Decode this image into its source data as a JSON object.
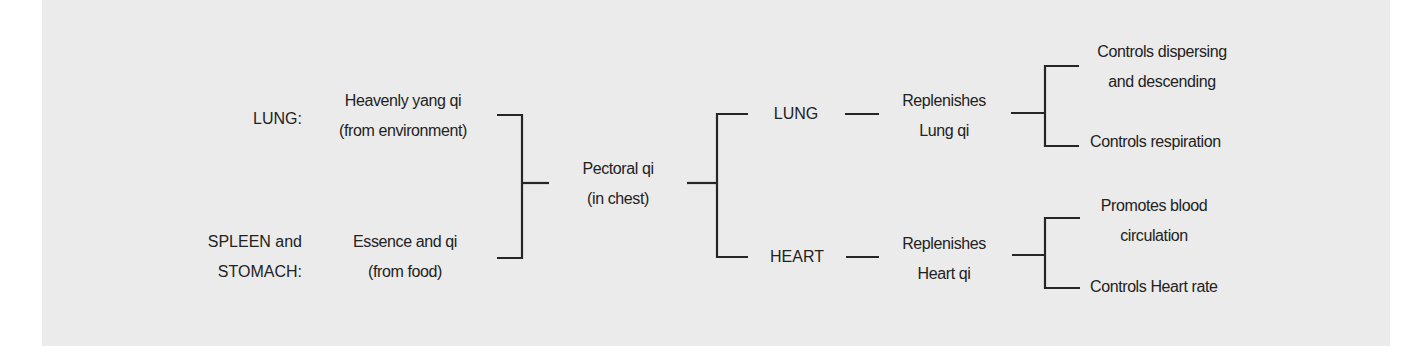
{
  "diagram": {
    "title": "",
    "colors": {
      "background": "#ebebeb",
      "line": "#262626",
      "text": "#222222"
    },
    "sources": [
      {
        "organ_lines": [
          "LUNG:"
        ],
        "content_lines": [
          "Heavenly yang qi",
          "(from environment)"
        ]
      },
      {
        "organ_lines": [
          "SPLEEN and",
          "STOMACH:"
        ],
        "content_lines": [
          "Essence and qi",
          "(from food)"
        ]
      }
    ],
    "center": {
      "lines": [
        "Pectoral qi",
        "(in chest)"
      ]
    },
    "branches": [
      {
        "organ": "LUNG",
        "effect_lines": [
          "Replenishes",
          "Lung qi"
        ],
        "functions": [
          {
            "lines": [
              "Controls dispersing",
              "and descending"
            ]
          },
          {
            "lines": [
              "Controls respiration"
            ]
          }
        ]
      },
      {
        "organ": "HEART",
        "effect_lines": [
          "Replenishes",
          "Heart qi"
        ],
        "functions": [
          {
            "lines": [
              "Promotes blood",
              "circulation"
            ]
          },
          {
            "lines": [
              "Controls Heart rate"
            ]
          }
        ]
      }
    ]
  }
}
